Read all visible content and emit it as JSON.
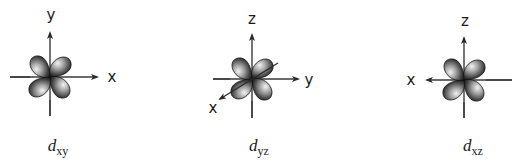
{
  "diagram": {
    "type": "d-orbital-illustrations",
    "panels": [
      {
        "id": "dxy",
        "caption_main": "d",
        "caption_sub": "xy",
        "center": [
          50,
          77
        ],
        "axes": {
          "horizontal": {
            "label": "x",
            "from": [
              10,
              77
            ],
            "to": [
              97,
              77
            ],
            "arrow": "end",
            "label_pos": [
              112,
              82
            ]
          },
          "vertical": {
            "label": "y",
            "from": [
              50,
              116
            ],
            "to": [
              50,
              33
            ],
            "arrow": "end",
            "label_pos": [
              51,
              20
            ]
          }
        },
        "lobes_orientation": "between-axes",
        "caption_x": 58
      },
      {
        "id": "dyz",
        "caption_main": "d",
        "caption_sub": "yz",
        "center": [
          252,
          79
        ],
        "axes": {
          "horizontal": {
            "label": "y",
            "from": [
              213,
              79
            ],
            "to": [
              298,
              79
            ],
            "arrow": "end",
            "label_pos": [
              309,
              85
            ]
          },
          "vertical": {
            "label": "z",
            "from": [
              252,
              118
            ],
            "to": [
              252,
              35
            ],
            "arrow": "end",
            "label_pos": [
              252,
              24
            ]
          },
          "diagonal": {
            "label": "x",
            "from": [
              278,
              63
            ],
            "to": [
              220,
              99
            ],
            "arrow": "end",
            "label_pos": [
              213,
              112
            ]
          }
        },
        "lobes_orientation": "between-axes",
        "caption_x": 259
      },
      {
        "id": "dxz",
        "caption_main": "d",
        "caption_sub": "xz",
        "center": [
          464,
          80
        ],
        "axes": {
          "horizontal": {
            "label": "x",
            "from": [
              512,
              80
            ],
            "to": [
              427,
              80
            ],
            "arrow": "end",
            "label_pos": [
              411,
              85
            ]
          },
          "vertical": {
            "label": "z",
            "from": [
              464,
              118
            ],
            "to": [
              464,
              38
            ],
            "arrow": "end",
            "label_pos": [
              465,
              26
            ]
          }
        },
        "lobes_orientation": "between-axes",
        "caption_x": 473
      }
    ],
    "colors": {
      "axis": "#3a3a3a",
      "lobe_dark": "#1e1e1e",
      "lobe_mid": "#6e6e6e",
      "lobe_light": "#e8e8e8",
      "text": "#1a1a1a"
    }
  },
  "labels": {
    "dxy": {
      "x": "x",
      "y": "y"
    },
    "dyz": {
      "z": "z",
      "y": "y",
      "x": "x"
    },
    "dxz": {
      "z": "z",
      "x": "x"
    }
  },
  "captions": {
    "dxy": {
      "main": "d",
      "sub": "xy"
    },
    "dyz": {
      "main": "d",
      "sub": "yz"
    },
    "dxz": {
      "main": "d",
      "sub": "xz"
    }
  }
}
